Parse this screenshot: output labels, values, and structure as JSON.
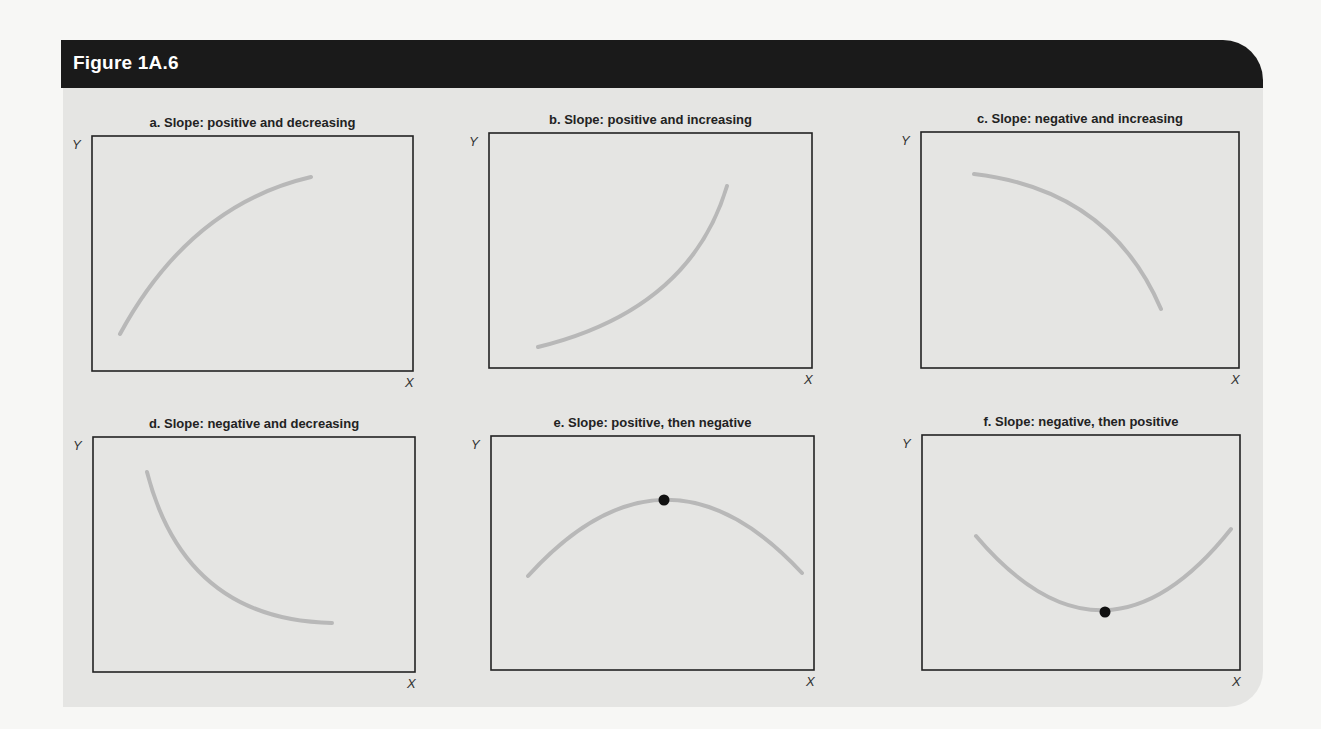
{
  "figure": {
    "title": "Figure 1A.6",
    "colors": {
      "header_bg": "#1a1a1a",
      "panel_bg": "#e5e5e3",
      "curve": "#b8b8b8",
      "axes": "#222222",
      "point": "#111111"
    }
  },
  "chart_data": [
    {
      "type": "line",
      "title": "a. Slope: positive and decreasing",
      "xlabel": "X",
      "ylabel": "Y",
      "grid": false,
      "box": {
        "x": 92,
        "y": 136,
        "w": 321,
        "h": 235
      },
      "curve": {
        "start": [
          120,
          334
        ],
        "control": [
          190,
          205
        ],
        "end": [
          311,
          177
        ]
      },
      "highlight_point": null,
      "description": "Concave increasing curve"
    },
    {
      "type": "line",
      "title": "b. Slope: positive and increasing",
      "xlabel": "X",
      "ylabel": "Y",
      "grid": false,
      "box": {
        "x": 489,
        "y": 133,
        "w": 323,
        "h": 235
      },
      "curve": {
        "start": [
          538,
          347
        ],
        "control": [
          690,
          310
        ],
        "end": [
          727,
          186
        ]
      },
      "highlight_point": null,
      "description": "Convex increasing curve"
    },
    {
      "type": "line",
      "title": "c. Slope: negative and increasing",
      "xlabel": "X",
      "ylabel": "Y",
      "grid": false,
      "box": {
        "x": 921,
        "y": 132,
        "w": 318,
        "h": 236
      },
      "curve": {
        "start": [
          974,
          174
        ],
        "control": [
          1110,
          190
        ],
        "end": [
          1161,
          309
        ]
      },
      "highlight_point": null,
      "description": "Concave decreasing curve"
    },
    {
      "type": "line",
      "title": "d. Slope: negative and decreasing",
      "xlabel": "X",
      "ylabel": "Y",
      "grid": false,
      "box": {
        "x": 93,
        "y": 437,
        "w": 322,
        "h": 235
      },
      "curve": {
        "start": [
          147,
          472
        ],
        "control": [
          185,
          620
        ],
        "end": [
          332,
          623
        ]
      },
      "highlight_point": null,
      "description": "Convex decreasing curve"
    },
    {
      "type": "line",
      "title": "e. Slope: positive, then negative",
      "xlabel": "X",
      "ylabel": "Y",
      "grid": false,
      "box": {
        "x": 491,
        "y": 436,
        "w": 323,
        "h": 234
      },
      "curve": {
        "start": [
          528,
          576
        ],
        "control": [
          665,
          425
        ],
        "end": [
          802,
          573
        ]
      },
      "highlight_point": [
        664,
        500
      ],
      "description": "Inverted-U curve with maximum marked"
    },
    {
      "type": "line",
      "title": "f. Slope: negative, then positive",
      "xlabel": "X",
      "ylabel": "Y",
      "grid": false,
      "box": {
        "x": 922,
        "y": 435,
        "w": 318,
        "h": 235
      },
      "curve": {
        "start": [
          976,
          536
        ],
        "control": [
          1105,
          688
        ],
        "end": [
          1231,
          529
        ]
      },
      "highlight_point": [
        1105,
        612
      ],
      "description": "U-shaped curve with minimum marked"
    }
  ]
}
